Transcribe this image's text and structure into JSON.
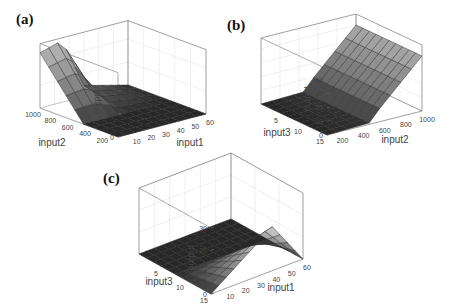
{
  "figure": {
    "panels": [
      {
        "id": "a",
        "label": "(a)"
      },
      {
        "id": "b",
        "label": "(b)"
      },
      {
        "id": "c",
        "label": "(c)"
      }
    ]
  },
  "chart_data": [
    {
      "type": "surface3d",
      "panel_label": "(a)",
      "title": "",
      "xlabel": "input1",
      "ylabel": "input2",
      "zlabel": "output",
      "x_ticks": [
        10,
        20,
        30,
        40,
        50,
        60
      ],
      "y_ticks": [
        200,
        400,
        600,
        800,
        1000
      ],
      "z_ticks": [
        0,
        10,
        20
      ],
      "xlim": [
        0,
        60
      ],
      "ylim": [
        100,
        1000
      ],
      "zlim": [
        0,
        28
      ],
      "grid": true,
      "description": "Output is ~0 for input2 below ~500 across all input1; rises with input2 up to ~24 at input2=1000 when input1 is small; decreases to ~0 as input1 increases beyond ~30.",
      "x": [
        0,
        6,
        12,
        18,
        24,
        30,
        36,
        42,
        48,
        54,
        60
      ],
      "y": [
        100,
        200,
        300,
        400,
        500,
        600,
        700,
        800,
        900,
        1000
      ],
      "z_samples": {
        "input1=0": [
          0,
          0,
          0,
          0,
          0,
          5,
          10,
          15,
          20,
          24
        ],
        "input1=15": [
          0,
          0,
          0,
          0,
          0,
          5,
          10,
          15,
          21,
          27
        ],
        "input1=30": [
          0,
          0,
          0,
          0,
          0,
          1,
          2,
          3,
          4,
          5
        ],
        "input1=60": [
          0,
          0,
          0,
          0,
          0,
          0,
          0,
          0,
          0,
          0
        ]
      }
    },
    {
      "type": "surface3d",
      "panel_label": "(b)",
      "title": "",
      "xlabel": "input2",
      "ylabel": "input3",
      "zlabel": "output",
      "x_ticks": [
        200,
        400,
        600,
        800,
        1000
      ],
      "y_ticks": [
        5,
        10,
        15
      ],
      "z_ticks": [
        0,
        10,
        20,
        30,
        40
      ],
      "xlim": [
        100,
        1000
      ],
      "ylim": [
        0,
        15
      ],
      "zlim": [
        0,
        45
      ],
      "grid": true,
      "description": "Output ~0 for input2 below ~500; increases roughly linearly with input2 to ~40 at input2=1000; nearly constant with respect to input3.",
      "x": [
        100,
        200,
        300,
        400,
        500,
        600,
        700,
        800,
        900,
        1000
      ],
      "y": [
        0,
        1.5,
        3,
        4.5,
        6,
        7.5,
        9,
        10.5,
        12,
        13.5,
        15
      ],
      "z_samples": {
        "input2=100": 0,
        "input2=500": 2,
        "input2=600": 10,
        "input2=800": 25,
        "input2=1000": 40
      }
    },
    {
      "type": "surface3d",
      "panel_label": "(c)",
      "title": "",
      "xlabel": "input1",
      "ylabel": "input3",
      "zlabel": "output",
      "x_ticks": [
        10,
        20,
        30,
        40,
        50,
        60
      ],
      "y_ticks": [
        5,
        10,
        15
      ],
      "z_ticks": [
        0,
        10,
        20,
        30
      ],
      "xlim": [
        0,
        60
      ],
      "ylim": [
        0,
        15
      ],
      "zlim": [
        0,
        30
      ],
      "grid": true,
      "description": "Pyramid-shaped surface: output 0 for input3 above ~7.5; for small input3 a ridge peaks at ~20 near input1=40, input3=0, falling to 0 at input1=0 and input1=60.",
      "x": [
        0,
        6,
        12,
        18,
        24,
        30,
        36,
        42,
        48,
        54,
        60
      ],
      "y": [
        0,
        1.5,
        3,
        4.5,
        6,
        7.5,
        9,
        10.5,
        12,
        13.5,
        15
      ],
      "peak": {
        "input1": 40,
        "input3": 0,
        "output": 20
      }
    }
  ]
}
